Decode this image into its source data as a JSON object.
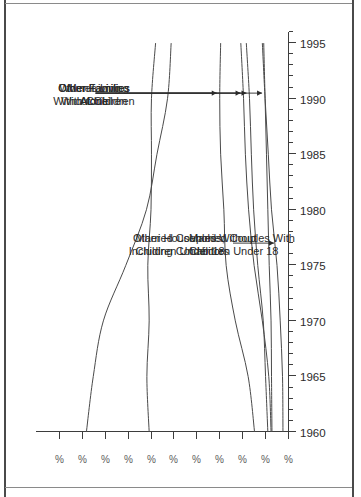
{
  "figure": {
    "frame_color": "#4a4a4a",
    "background": "#ffffff",
    "orientation_note": "rotated"
  },
  "chart_data": {
    "type": "line",
    "title": "",
    "subtitle": "",
    "xlabel": "",
    "ylabel": "",
    "grid": false,
    "legend_position": "inline-annotations",
    "line_color": "#4a4a4a",
    "xlim": [
      1960,
      1996
    ],
    "ylim": [
      0,
      55
    ],
    "x_major_ticks": [
      1960,
      1965,
      1970,
      1975,
      1980,
      1985,
      1990,
      1995
    ],
    "x_tick_labels": [
      "1960",
      "1965",
      "1970",
      "1975",
      "1980",
      "1985",
      "1990",
      "1995"
    ],
    "x_minor_tick_step": 1,
    "y_ticks": [
      0,
      5,
      10,
      15,
      20,
      25,
      30,
      35,
      40,
      45,
      50
    ],
    "y_tick_labels": [
      "%",
      "%",
      "%",
      "%",
      "%",
      "%",
      "%",
      "%",
      "%",
      "%",
      "%"
    ],
    "x": [
      1960,
      1965,
      1970,
      1975,
      1980,
      1985,
      1990,
      1995
    ],
    "series": [
      {
        "name": "Married Couples With Children Under 18",
        "label": "Married Couples With\nChildren Under 18",
        "label_line1": "Married Couples With",
        "label_line2": "Children Under 18",
        "values": [
          44.0,
          42.5,
          40.3,
          35.4,
          30.9,
          28.6,
          26.3,
          25.5
        ]
      },
      {
        "name": "Married Couples Without Children Under 18",
        "label": "Married Couples Without\nChildren Under 18",
        "label_line1": "Married Couples Without",
        "label_line2": "Children Under 18",
        "values": [
          30.3,
          30.8,
          30.3,
          30.6,
          29.9,
          29.8,
          29.8,
          28.9
        ]
      },
      {
        "name": "Other Families With Children",
        "label": "Other Families\nWith Children",
        "label_line1": "Other Families",
        "label_line2": "With Children",
        "values": [
          4.4,
          4.9,
          5.4,
          6.6,
          7.5,
          8.0,
          8.4,
          9.1
        ]
      },
      {
        "name": "Other Families Without Children",
        "label": "Other Families\nWithout Children",
        "label_line1": "Other Families",
        "label_line2": "Without Children",
        "values": [
          3.5,
          3.6,
          3.7,
          4.1,
          4.4,
          4.7,
          5.0,
          5.3
        ]
      },
      {
        "name": "Men Living Alone",
        "label": "Men Living\nAlone",
        "label_line1": "Men Living",
        "label_line2": "Alone",
        "values": [
          3.7,
          4.2,
          5.6,
          7.4,
          8.6,
          9.3,
          9.7,
          10.3
        ]
      },
      {
        "name": "Women Living Alone",
        "label": "Women Living\nAlone",
        "label_line1": "Women Living",
        "label_line2": "Alone",
        "values": [
          7.3,
          8.7,
          11.5,
          13.5,
          14.0,
          14.7,
          14.9,
          14.7
        ]
      },
      {
        "name": "Other Households, Including Cohabitors",
        "label": "Other Households,\nIncluding Cohabitors",
        "label_line1": "Other Households,",
        "label_line2": "Including Cohabitors",
        "values": [
          1.1,
          1.2,
          1.7,
          2.4,
          3.6,
          4.3,
          5.0,
          5.6
        ]
      }
    ]
  }
}
